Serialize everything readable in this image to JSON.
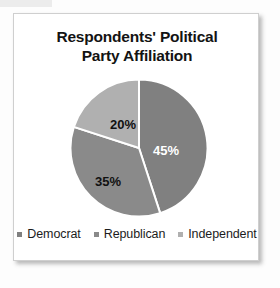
{
  "card": {
    "border_color": "#cfcfcf",
    "background": "#ffffff"
  },
  "chart_data": {
    "type": "pie",
    "title": "Respondents' Political Party Affiliation",
    "title_line_1": "Respondents' Political",
    "title_line_2": "Party Affiliation",
    "categories": [
      "Democrat",
      "Republican",
      "Independent"
    ],
    "values": [
      45,
      35,
      20
    ],
    "value_labels": [
      "45%",
      "35%",
      "20%"
    ],
    "unit": "%",
    "colors": [
      "#808080",
      "#8a8a8a",
      "#b0b0b0"
    ],
    "label_colors": [
      "#ffffff",
      "#111111",
      "#111111"
    ],
    "slice_border_color": "#ffffff",
    "start_angle_deg": 0,
    "direction": "clockwise",
    "legend_position": "bottom",
    "grid": false,
    "xlabel": "",
    "ylabel": "",
    "slices": [
      {
        "name": "Democrat",
        "value": 45,
        "label": "45%",
        "color": "#808080",
        "label_color": "#ffffff",
        "label_x": 96,
        "label_y": 73
      },
      {
        "name": "Republican",
        "value": 35,
        "label": "35%",
        "color": "#8a8a8a",
        "label_color": "#111111",
        "label_x": 38,
        "label_y": 104
      },
      {
        "name": "Independent",
        "value": 20,
        "label": "20%",
        "color": "#b0b0b0",
        "label_color": "#111111",
        "label_x": 53,
        "label_y": 47
      }
    ]
  },
  "legend": {
    "items": [
      {
        "label": "Democrat",
        "color": "#808080"
      },
      {
        "label": "Republican",
        "color": "#8a8a8a"
      },
      {
        "label": "Independent",
        "color": "#b0b0b0"
      }
    ]
  }
}
